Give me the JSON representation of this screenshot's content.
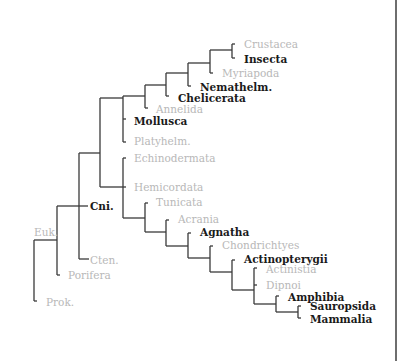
{
  "diagram": {
    "type": "phylogenetic-tree",
    "colors": {
      "branch": "#3a3a3a",
      "highlighted_label": "#1a1a1a",
      "faded_label": "#b8b8b8",
      "frame": "#4a4a4a"
    },
    "labels": [
      {
        "id": "crustacea",
        "text": "Crustacea",
        "style": "faded",
        "x": 244,
        "y": 38
      },
      {
        "id": "insecta",
        "text": "Insecta",
        "style": "bold",
        "x": 244,
        "y": 53
      },
      {
        "id": "myriapoda",
        "text": "Myriapoda",
        "style": "faded",
        "x": 222,
        "y": 67
      },
      {
        "id": "nemathelm",
        "text": "Nemathelm.",
        "style": "bold",
        "x": 200,
        "y": 81
      },
      {
        "id": "chelicerata",
        "text": "Chelicerata",
        "style": "bold",
        "x": 178,
        "y": 92
      },
      {
        "id": "annelida",
        "text": "Annelida",
        "style": "faded",
        "x": 156,
        "y": 103
      },
      {
        "id": "mollusca",
        "text": "Mollusca",
        "style": "bold",
        "x": 134,
        "y": 115
      },
      {
        "id": "platyhelm",
        "text": "Platyhelm.",
        "style": "faded",
        "x": 134,
        "y": 135
      },
      {
        "id": "echinodermata",
        "text": "Echinodermata",
        "style": "faded",
        "x": 134,
        "y": 152
      },
      {
        "id": "hemicordata",
        "text": "Hemicordata",
        "style": "faded",
        "x": 134,
        "y": 181
      },
      {
        "id": "tunicata",
        "text": "Tunicata",
        "style": "faded",
        "x": 156,
        "y": 196
      },
      {
        "id": "acrania",
        "text": "Acrania",
        "style": "faded",
        "x": 178,
        "y": 213
      },
      {
        "id": "agnatha",
        "text": "Agnatha",
        "style": "bold",
        "x": 200,
        "y": 226
      },
      {
        "id": "chondrichtyes",
        "text": "Chondrichtyes",
        "style": "faded",
        "x": 222,
        "y": 239
      },
      {
        "id": "actinopterygii",
        "text": "Actinopterygii",
        "style": "bold",
        "x": 244,
        "y": 253
      },
      {
        "id": "actinistia",
        "text": "Actinistia",
        "style": "faded",
        "x": 266,
        "y": 263
      },
      {
        "id": "dipnoi",
        "text": "Dipnoi",
        "style": "faded",
        "x": 266,
        "y": 279
      },
      {
        "id": "amphibia",
        "text": "Amphibia",
        "style": "bold",
        "x": 288,
        "y": 291
      },
      {
        "id": "sauropsida",
        "text": "Sauropsida",
        "style": "bold",
        "x": 310,
        "y": 300
      },
      {
        "id": "mammalia",
        "text": "Mammalia",
        "style": "bold",
        "x": 310,
        "y": 313
      },
      {
        "id": "cni",
        "text": "Cni.",
        "style": "bold",
        "x": 90,
        "y": 200
      },
      {
        "id": "euk",
        "text": "Euk.",
        "style": "faded",
        "x": 34,
        "y": 226
      },
      {
        "id": "cten",
        "text": "Cten.",
        "style": "faded",
        "x": 90,
        "y": 254
      },
      {
        "id": "porifera",
        "text": "Porifera",
        "style": "faded",
        "x": 68,
        "y": 269
      },
      {
        "id": "prok",
        "text": "Prok.",
        "style": "faded",
        "x": 46,
        "y": 296
      }
    ]
  }
}
